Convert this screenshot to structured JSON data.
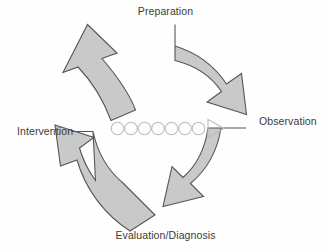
{
  "diagram": {
    "type": "cyclical-process-diagram",
    "title": "",
    "direction": "clockwise",
    "colors": {
      "background": "#fefefe",
      "arrow_fill": "#c9c9c9",
      "arrow_stroke": "#555555",
      "marker_stroke": "#bdbdbd",
      "label_text": "#3b3b3b"
    },
    "nodes": [
      {
        "id": "preparation",
        "label": "Preparation",
        "position": "top"
      },
      {
        "id": "observation",
        "label": "Observation",
        "position": "right"
      },
      {
        "id": "evaluation",
        "label": "Evaluation/Diagnosis",
        "position": "bottom"
      },
      {
        "id": "intervention",
        "label": "Intervention",
        "position": "left"
      }
    ],
    "arrows": [
      {
        "id": "arrow-to-preparation",
        "from": "intervention",
        "to": "preparation",
        "quadrant": "top-left",
        "points_toward": "up-right"
      },
      {
        "id": "arrow-to-observation",
        "from": "preparation",
        "to": "observation",
        "quadrant": "top-right",
        "points_toward": "down-right"
      },
      {
        "id": "arrow-to-evaluation",
        "from": "observation",
        "to": "evaluation",
        "quadrant": "bottom-right",
        "points_toward": "down-left"
      },
      {
        "id": "arrow-to-intervention",
        "from": "evaluation",
        "to": "intervention",
        "quadrant": "bottom-left",
        "points_toward": "up-left"
      }
    ],
    "center_marker": {
      "id": "progression-marker",
      "circle_count": 7,
      "terminator": "right-triangle",
      "description": "seven small outlined circles followed by an outlined right-pointing triangle"
    }
  }
}
